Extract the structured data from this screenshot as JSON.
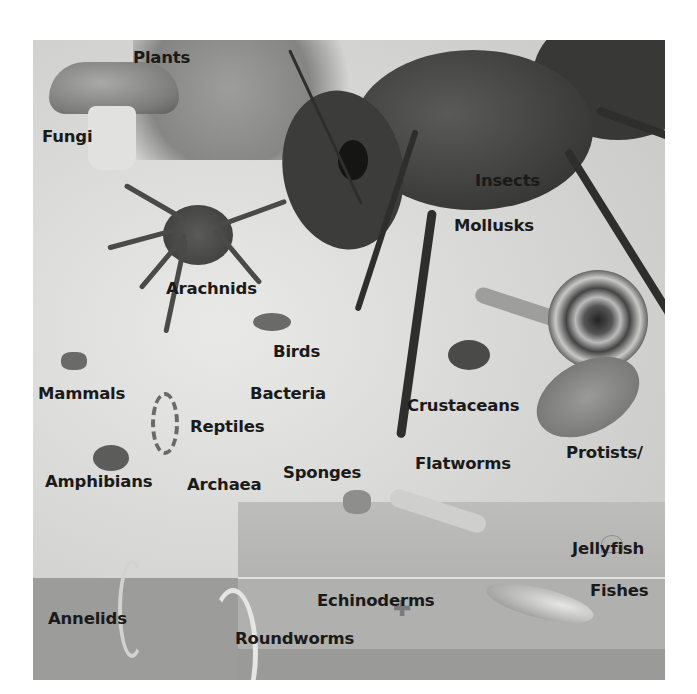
{
  "figure": {
    "labels": {
      "plants": "Plants",
      "fungi": "Fungi",
      "arachnids": "Arachnids",
      "insects": "Insects",
      "mollusks": "Mollusks",
      "birds": "Birds",
      "mammals": "Mammals",
      "bacteria": "Bacteria",
      "reptiles": "Reptiles",
      "crustaceans": "Crustaceans",
      "amphibians": "Amphibians",
      "archaea": "Archaea",
      "sponges": "Sponges",
      "flatworms": "Flatworms",
      "protists_line1": "Protists/",
      "protists_line2": "chromists",
      "jellyfish": "Jellyfish",
      "fishes": "Fishes",
      "echinoderms": "Echinoderms",
      "annelids": "Annelids",
      "roundworms": "Roundworms"
    }
  }
}
